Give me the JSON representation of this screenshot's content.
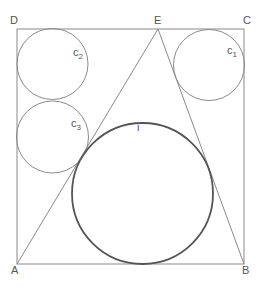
{
  "diagram": {
    "type": "geometry",
    "colors": {
      "background": "#ffffff",
      "lines": "#8a8a8a",
      "incircle": "#555555",
      "labels": "#555555"
    },
    "points": {
      "A": {
        "label": "A",
        "x": 17,
        "y": 264
      },
      "B": {
        "label": "B",
        "x": 244,
        "y": 264
      },
      "C": {
        "label": "C",
        "x": 244,
        "y": 29
      },
      "D": {
        "label": "D",
        "x": 17,
        "y": 29
      },
      "E": {
        "label": "E",
        "x": 158,
        "y": 29
      }
    },
    "circles": {
      "i": {
        "label": "i",
        "sub": "",
        "cx": 142.5,
        "cy": 193.5,
        "r": 70.5
      },
      "c1": {
        "label": "c",
        "sub": "1",
        "cx": 209,
        "cy": 65,
        "r": 35.5
      },
      "c2": {
        "label": "c",
        "sub": "2",
        "cx": 52.5,
        "cy": 64,
        "r": 35.5
      },
      "c3": {
        "label": "c",
        "sub": "3",
        "cx": 52.5,
        "cy": 137,
        "r": 36
      }
    }
  }
}
